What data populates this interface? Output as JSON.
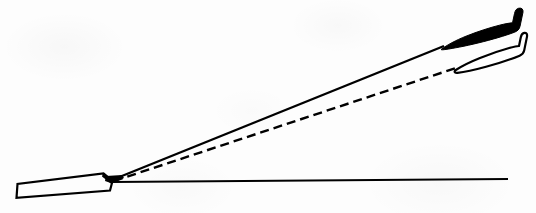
{
  "figure": {
    "domain": "Diagram",
    "kind": "line-diagram",
    "width": 536,
    "height": 213,
    "background_color": "#fdfdfd",
    "ink_color": "#000000"
  },
  "elements": {
    "runway": {
      "name": "runway",
      "style": "outlined",
      "stroke_color": "#000000",
      "stroke_width": 2.2,
      "fill": "none",
      "points": "16,198 17,183 104,174 113,182 110,190"
    },
    "ground_line": {
      "name": "horizontal-ground-reference-line",
      "style": "solid",
      "stroke_color": "#000000",
      "stroke_width": 1.8,
      "x1": 112,
      "y1": 182,
      "x2": 508,
      "y2": 179
    },
    "solid_path": {
      "name": "solid-flight-path",
      "style": "solid",
      "stroke_color": "#000000",
      "stroke_width": 2.4,
      "x1": 112,
      "y1": 180,
      "x2": 444,
      "y2": 46
    },
    "dashed_path": {
      "name": "dashed-flight-path",
      "style": "dashed",
      "stroke_color": "#000000",
      "stroke_width": 2.4,
      "dash_length": 9,
      "dash_gap": 5,
      "x1": 114,
      "y1": 181,
      "x2": 456,
      "y2": 68
    },
    "aircraft_solid": {
      "name": "aircraft-filled",
      "style": "filled",
      "fill_color": "#000000",
      "stroke_color": "#000000",
      "nose_x": 443,
      "nose_y": 48,
      "tail_x": 523,
      "tail_y": 10
    },
    "aircraft_outline": {
      "name": "aircraft-outlined",
      "style": "outlined",
      "fill": "none",
      "stroke_color": "#000000",
      "stroke_width": 2.2,
      "nose_x": 455,
      "nose_y": 70,
      "tail_x": 524,
      "tail_y": 34
    }
  }
}
